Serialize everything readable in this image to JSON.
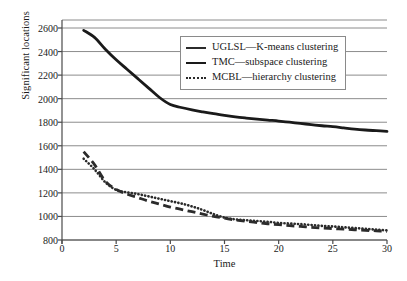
{
  "chart_data": {
    "type": "line",
    "title": "",
    "xlabel": "Time",
    "ylabel": "Significant locations",
    "xlim": [
      0,
      30
    ],
    "ylim": [
      800,
      2600
    ],
    "xticks": [
      0,
      5,
      10,
      15,
      20,
      25,
      30
    ],
    "yticks": [
      800,
      1000,
      1200,
      1400,
      1600,
      1800,
      2000,
      2200,
      2400,
      2600
    ],
    "grid": "horizontal",
    "legend_position": "upper-right",
    "series": [
      {
        "name": "UGLSL—K-means clustering",
        "style": "dashed",
        "color": "#2b2b2b",
        "x": [
          2,
          3,
          4,
          5,
          6,
          7,
          8,
          9,
          10,
          11,
          12,
          13,
          14,
          15,
          16,
          17,
          18,
          19,
          20,
          21,
          22,
          23,
          24,
          25,
          26,
          27,
          28,
          29,
          30
        ],
        "y": [
          1550,
          1440,
          1300,
          1230,
          1190,
          1160,
          1130,
          1105,
          1080,
          1060,
          1040,
          1020,
          1000,
          985,
          970,
          958,
          948,
          938,
          930,
          922,
          915,
          908,
          902,
          897,
          892,
          887,
          882,
          878,
          872
        ]
      },
      {
        "name": "TMC—subspace clustering",
        "style": "solid",
        "color": "#1a1a1a",
        "x": [
          2,
          3,
          4,
          5,
          6,
          7,
          8,
          9,
          10,
          11,
          12,
          13,
          14,
          15,
          16,
          17,
          18,
          19,
          20,
          21,
          22,
          23,
          24,
          25,
          26,
          27,
          28,
          29,
          30
        ],
        "y": [
          2580,
          2520,
          2420,
          2330,
          2250,
          2170,
          2090,
          2010,
          1950,
          1925,
          1905,
          1888,
          1872,
          1858,
          1845,
          1835,
          1826,
          1818,
          1810,
          1800,
          1790,
          1780,
          1770,
          1762,
          1752,
          1742,
          1734,
          1728,
          1722
        ]
      },
      {
        "name": "MCBL—hierarchy clustering",
        "style": "dotted",
        "color": "#2b2b2b",
        "x": [
          2,
          3,
          4,
          5,
          6,
          7,
          8,
          9,
          10,
          11,
          12,
          13,
          14,
          15,
          16,
          17,
          18,
          19,
          20,
          21,
          22,
          23,
          24,
          25,
          26,
          27,
          28,
          29,
          30
        ],
        "y": [
          1490,
          1400,
          1290,
          1225,
          1205,
          1190,
          1170,
          1150,
          1130,
          1110,
          1085,
          1055,
          1020,
          990,
          975,
          968,
          962,
          955,
          945,
          940,
          935,
          928,
          920,
          915,
          908,
          902,
          895,
          888,
          882
        ]
      }
    ]
  },
  "legend": {
    "items": [
      {
        "label": "UGLSL—K-means clustering",
        "key": "dashed-line-key"
      },
      {
        "label": "TMC—subspace clustering",
        "key": "solid-line-key"
      },
      {
        "label": "MCBL—hierarchy clustering",
        "key": "dotted-line-key"
      }
    ]
  }
}
